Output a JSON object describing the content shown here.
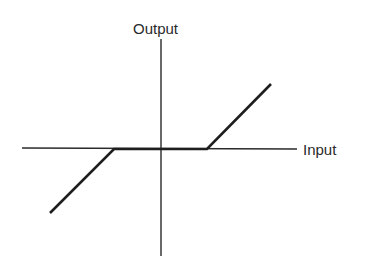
{
  "diagram": {
    "y_axis_label": "Output",
    "x_axis_label": "Input",
    "colors": {
      "axis": "#2a2a2a",
      "curve": "#1e1e1e",
      "background": "#ffffff"
    },
    "geometry": {
      "origin": [
        161,
        148
      ],
      "x_axis": [
        22,
        297
      ],
      "y_axis": [
        39,
        256
      ],
      "curve_points": [
        [
          50,
          213
        ],
        [
          114,
          149
        ],
        [
          207,
          149
        ],
        [
          271,
          84
        ]
      ]
    }
  }
}
